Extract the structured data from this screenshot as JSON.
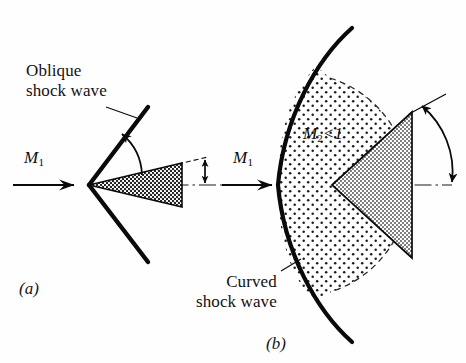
{
  "figure": {
    "background_color": "#fefefe",
    "ink_color": "#000000"
  },
  "panel_a": {
    "letter": "(a)",
    "shock_label": "Oblique\nshock wave",
    "upstream_mach": "M",
    "upstream_mach_sub": "1",
    "description": "Slender wedge with attached oblique shock waves"
  },
  "panel_b": {
    "letter": "(b)",
    "shock_label": "Curved\nshock wave",
    "upstream_mach": "M",
    "upstream_mach_sub": "1",
    "region_mach": "M",
    "region_mach_sub": "2",
    "region_relation": "<",
    "region_value": "1",
    "description": "Blunt wedge with detached curved bow shock and subsonic region"
  },
  "colors": {
    "wedge_fill_a": "#8a8a8a",
    "wedge_fill_b": "#b4b4b4",
    "shock_region_fill": "#f2f2f2",
    "line": "#0a0a0a"
  }
}
